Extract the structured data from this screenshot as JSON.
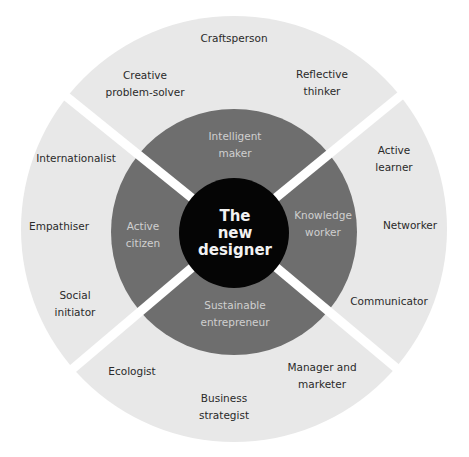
{
  "diagram": {
    "center": {
      "label": "The\nnew\ndesigner"
    },
    "middle_ring": [
      {
        "label": "Intelligent\nmaker"
      },
      {
        "label": "Knowledge\nworker"
      },
      {
        "label": "Sustainable\nentrepreneur"
      },
      {
        "label": "Active\ncitizen"
      }
    ],
    "outer_ring": [
      {
        "label": "Craftsperson"
      },
      {
        "label": "Creative\nproblem-solver"
      },
      {
        "label": "Reflective\nthinker"
      },
      {
        "label": "Active\nlearner"
      },
      {
        "label": "Networker"
      },
      {
        "label": "Communicator"
      },
      {
        "label": "Manager and\nmarketer"
      },
      {
        "label": "Business\nstrategist"
      },
      {
        "label": "Ecologist"
      },
      {
        "label": "Social\ninitiator"
      },
      {
        "label": "Empathiser"
      },
      {
        "label": "Internationalist"
      }
    ],
    "colors": {
      "outer_ring": "#e8e8e8",
      "middle_ring": "#6e6e6e",
      "center": "#050505",
      "divider": "#ffffff",
      "outer_text": "#2a2a2a",
      "middle_text": "#d0d0d0",
      "center_text": "#f2f2f2"
    }
  }
}
